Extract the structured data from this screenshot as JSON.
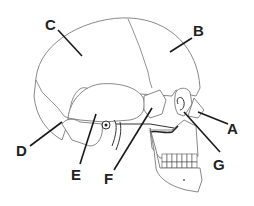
{
  "diagram": {
    "labels": [
      {
        "id": "A",
        "text": "A"
      },
      {
        "id": "B",
        "text": "B"
      },
      {
        "id": "C",
        "text": "C"
      },
      {
        "id": "D",
        "text": "D"
      },
      {
        "id": "E",
        "text": "E"
      },
      {
        "id": "F",
        "text": "F"
      },
      {
        "id": "G",
        "text": "G"
      }
    ],
    "colors": {
      "line": "#1a1a1a",
      "outline": "#6a6a6a",
      "background": "#ffffff"
    }
  }
}
